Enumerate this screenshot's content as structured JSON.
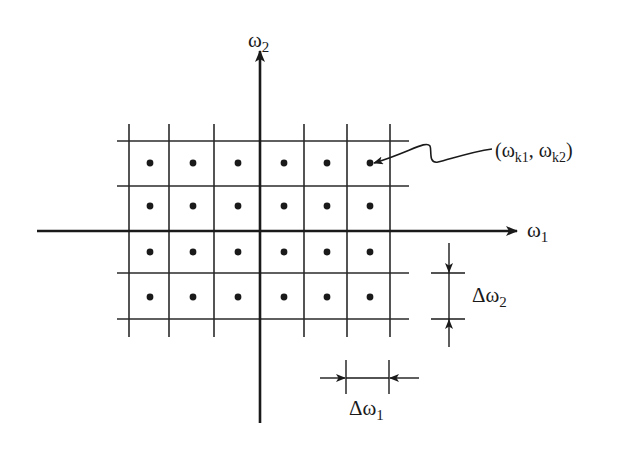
{
  "diagram": {
    "axes": {
      "horizontal": {
        "label": "ω",
        "subscript": "1"
      },
      "vertical": {
        "label": "ω",
        "subscript": "2"
      }
    },
    "grid": {
      "columns": 6,
      "rows": 4,
      "vertical_lines_x": [
        129,
        169,
        214,
        304,
        347,
        390
      ],
      "horizontal_lines_y": [
        141,
        186,
        273,
        319
      ],
      "dot_columns_x": [
        150,
        193,
        238,
        284,
        327,
        370
      ],
      "dot_rows_y": [
        163,
        206,
        252,
        297
      ]
    },
    "annotation": {
      "point_label_open": "(",
      "point_w1": "ω",
      "point_w1_sub": "k1",
      "point_sep": ", ",
      "point_w2": "ω",
      "point_w2_sub": "k2",
      "point_label_close": ")"
    },
    "dimensions": {
      "delta_w1": {
        "symbol": "Δω",
        "subscript": "1"
      },
      "delta_w2": {
        "symbol": "Δω",
        "subscript": "2"
      }
    },
    "colors": {
      "ink": "#1a1a1a",
      "background": "#ffffff"
    }
  }
}
